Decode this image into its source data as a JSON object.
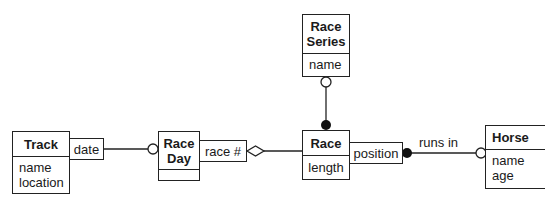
{
  "diagram": {
    "classes": [
      {
        "id": "race-series",
        "name": "Race\nSeries",
        "name_lines": [
          "Race",
          "Series"
        ],
        "attributes": [
          "name"
        ]
      },
      {
        "id": "track",
        "name": "Track",
        "attributes": [
          "name",
          "location"
        ]
      },
      {
        "id": "race-day",
        "name": "Race Day",
        "name_lines": [
          "Race",
          "Day"
        ],
        "attributes": []
      },
      {
        "id": "race",
        "name": "Race",
        "attributes": [
          "length"
        ]
      },
      {
        "id": "horse",
        "name": "Horse",
        "attributes": [
          "name",
          "age"
        ]
      }
    ],
    "qualifiers": [
      {
        "attached_to": "track",
        "label": "date"
      },
      {
        "attached_to": "race-day",
        "label": "race #"
      },
      {
        "attached_to": "race",
        "label": "position"
      }
    ],
    "associations": [
      {
        "from": "race-series",
        "to": "race",
        "from_end": "hollow-circle",
        "to_end": "filled-circle"
      },
      {
        "from": "track",
        "to": "race-day",
        "qualifier": "date",
        "to_end": "hollow-circle"
      },
      {
        "from": "race-day",
        "to": "race",
        "qualifier": "race #",
        "from_end": "aggregation-diamond"
      },
      {
        "from": "race",
        "to": "horse",
        "qualifier": "position",
        "label": "runs in",
        "from_end": "filled-circle",
        "to_end": "hollow-circle"
      }
    ],
    "association_labels": {
      "runs_in": "runs in"
    }
  }
}
